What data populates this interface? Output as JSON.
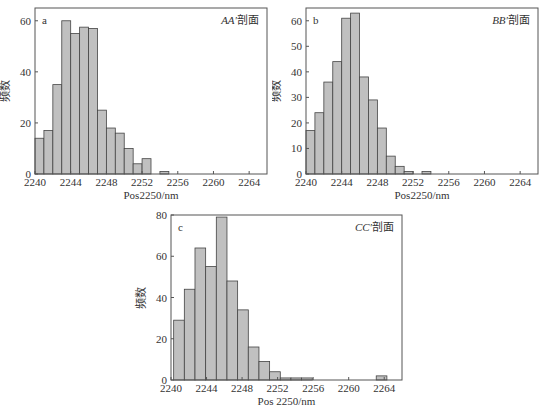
{
  "chart_data": [
    {
      "id": "a",
      "type": "bar",
      "panel_label": "a",
      "annotation": "AA′剖面",
      "annotation_italic": "AA′",
      "annotation_text": "剖面",
      "xlabel": "Pos2250/nm",
      "ylabel": "频数",
      "xlim": [
        2240,
        2266
      ],
      "ylim": [
        0,
        65
      ],
      "xticks": [
        2240,
        2244,
        2248,
        2252,
        2256,
        2260,
        2264
      ],
      "yticks": [
        0,
        20,
        40,
        60
      ],
      "bin_width": 1,
      "bin_starts": [
        2240,
        2241,
        2242,
        2243,
        2244,
        2245,
        2246,
        2247,
        2248,
        2249,
        2250,
        2251,
        2252,
        2253,
        2254
      ],
      "values": [
        14,
        17,
        35,
        60,
        55,
        57.5,
        57,
        25,
        18,
        16,
        10,
        4,
        6,
        0,
        1
      ],
      "bar_color": "#c0c0c0"
    },
    {
      "id": "b",
      "type": "bar",
      "panel_label": "b",
      "annotation": "BB′剖面",
      "annotation_italic": "BB′",
      "annotation_text": "剖面",
      "xlabel": "Pos2250/nm",
      "ylabel": "频数",
      "xlim": [
        2240,
        2266
      ],
      "ylim": [
        0,
        65
      ],
      "xticks": [
        2240,
        2244,
        2248,
        2252,
        2256,
        2260,
        2264
      ],
      "yticks": [
        0,
        10,
        20,
        30,
        40,
        50,
        60
      ],
      "bin_width": 1,
      "bin_starts": [
        2240,
        2241,
        2242,
        2243,
        2244,
        2245,
        2246,
        2247,
        2248,
        2249,
        2250,
        2251,
        2252,
        2253
      ],
      "values": [
        17,
        24,
        36,
        44,
        61,
        63,
        38,
        29,
        18,
        7,
        3,
        1,
        0,
        1
      ],
      "bar_color": "#c0c0c0"
    },
    {
      "id": "c",
      "type": "bar",
      "panel_label": "c",
      "annotation": "CC′剖面",
      "annotation_italic": "CC′",
      "annotation_text": "剖面",
      "xlabel": "Pos 2250/nm",
      "ylabel": "频数",
      "xlim": [
        2240,
        2266
      ],
      "ylim": [
        0,
        80
      ],
      "xticks": [
        2240,
        2244,
        2248,
        2252,
        2256,
        2260,
        2264
      ],
      "yticks": [
        0,
        20,
        40,
        60,
        80
      ],
      "bin_width": 1.2,
      "bin_starts": [
        2240.3,
        2241.5,
        2242.7,
        2243.9,
        2245.1,
        2246.3,
        2247.5,
        2248.7,
        2249.9,
        2251.1,
        2252.3,
        2253.5,
        2254.7,
        2263.1
      ],
      "values": [
        29,
        44,
        64,
        55,
        79,
        48,
        34,
        16,
        9,
        4,
        1,
        1,
        1,
        2
      ],
      "bar_color": "#c0c0c0"
    }
  ]
}
